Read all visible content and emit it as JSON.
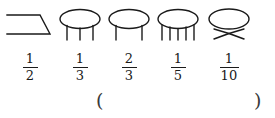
{
  "page": {
    "background_color": "#ffffff",
    "ink_color": "#1a1a1a"
  },
  "figures": [
    {
      "name": "open-parallelogram",
      "shape": "open-parallelogram",
      "legs": 0,
      "fraction": {
        "numerator": "1",
        "denominator": "2"
      }
    },
    {
      "name": "table-3-legs",
      "shape": "ellipse-table",
      "legs": 3,
      "fraction": {
        "numerator": "1",
        "denominator": "3"
      }
    },
    {
      "name": "table-2-legs",
      "shape": "ellipse-table",
      "legs": 2,
      "fraction": {
        "numerator": "2",
        "denominator": "3"
      }
    },
    {
      "name": "table-5-legs",
      "shape": "ellipse-table",
      "legs": 5,
      "fraction": {
        "numerator": "1",
        "denominator": "5"
      }
    },
    {
      "name": "table-curved-legs",
      "shape": "ellipse-table-curved-legs",
      "legs": 2,
      "fraction": {
        "numerator": "1",
        "denominator": "10"
      }
    }
  ],
  "answer_blank": {
    "open_paren": "(",
    "close_paren": ")",
    "value": ""
  }
}
